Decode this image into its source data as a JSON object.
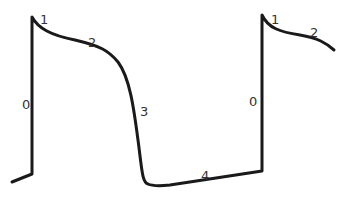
{
  "diagram": {
    "type": "cardiac-action-potential",
    "stroke_color": "#1a1a1a",
    "labels": [
      {
        "id": "phase0-a",
        "text": "0",
        "x": 22,
        "y": 109
      },
      {
        "id": "phase1-a",
        "text": "1",
        "x": 40,
        "y": 24
      },
      {
        "id": "phase2-a",
        "text": "2",
        "x": 88,
        "y": 47
      },
      {
        "id": "phase3",
        "text": "3",
        "x": 140,
        "y": 116
      },
      {
        "id": "phase4",
        "text": "4",
        "x": 201,
        "y": 180
      },
      {
        "id": "phase0-b",
        "text": "0",
        "x": 249,
        "y": 106
      },
      {
        "id": "phase1-b",
        "text": "1",
        "x": 271,
        "y": 24
      },
      {
        "id": "phase2-b",
        "text": "2",
        "x": 310,
        "y": 37
      }
    ]
  }
}
